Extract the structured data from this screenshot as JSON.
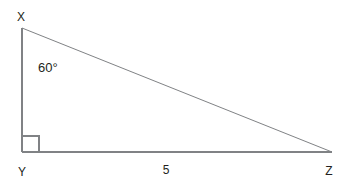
{
  "figure": {
    "kind": "right-triangle-diagram",
    "background_color": "#ffffff",
    "stroke_color": "#808285",
    "text_color": "#231f20",
    "vertices": {
      "x": {
        "label": "X",
        "px": [
          22,
          28
        ]
      },
      "y": {
        "label": "Y",
        "px": [
          22,
          152
        ]
      },
      "z": {
        "label": "Z",
        "px": [
          332,
          152
        ]
      }
    },
    "angles": {
      "at_x": {
        "label": "60°",
        "value": 60,
        "unit": "degrees"
      },
      "at_y": {
        "label": "",
        "value": 90,
        "unit": "degrees",
        "marker": "right-angle-square"
      }
    },
    "sides": {
      "yz": {
        "label": "5",
        "value": 5
      },
      "xy": {
        "label": ""
      },
      "xz": {
        "label": ""
      }
    },
    "icons": {
      "right_angle_marker": "right-angle-square-icon"
    }
  }
}
